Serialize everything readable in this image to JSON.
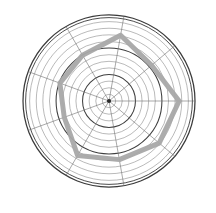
{
  "figure": {
    "background_color": "#ffffff",
    "width": 216,
    "height": 213,
    "title": "",
    "subtitle": ""
  },
  "style": {
    "grid_ring_color": "#8c8c8c",
    "grid_ring_color_emphasis": "#3f3f3f",
    "outer_ring_color": "#3a3a3a",
    "spoke_color": "#6e6e6e",
    "series_color": "#a8a8a8",
    "center_marker_color": "#2b2b2b"
  },
  "chart_data": {
    "type": "line",
    "plot_kind": "polar-radar",
    "title": "",
    "subtitle": "",
    "xlabel": "",
    "ylabel": "",
    "grid": true,
    "legend_position": "none",
    "center": {
      "x": 109,
      "y": 101
    },
    "outer_radius": 86,
    "rlim": [
      0,
      13
    ],
    "ring_count": 13,
    "ring_tick_values": [
      1,
      2,
      3,
      4,
      5,
      6,
      7,
      8,
      9,
      10,
      11,
      12,
      13
    ],
    "emphasized_ring_values": [
      4,
      8,
      13
    ],
    "theta_direction": "counterclockwise",
    "theta_zero_location": "E",
    "spoke_count": 9,
    "spoke_angles_deg": [
      0,
      40,
      80,
      120,
      160,
      200,
      240,
      280,
      320
    ],
    "categories": [
      "0",
      "40",
      "80",
      "120",
      "160",
      "200",
      "240",
      "280",
      "320"
    ],
    "tick_labels_visible": false,
    "series": [
      {
        "name": "series-1",
        "color": "#a8a8a8",
        "line_width": 5,
        "closed": true,
        "values": [
          10.6,
          8.4,
          10.1,
          8.0,
          7.9,
          7.2,
          9.5,
          9.0,
          9.9
        ]
      }
    ]
  }
}
